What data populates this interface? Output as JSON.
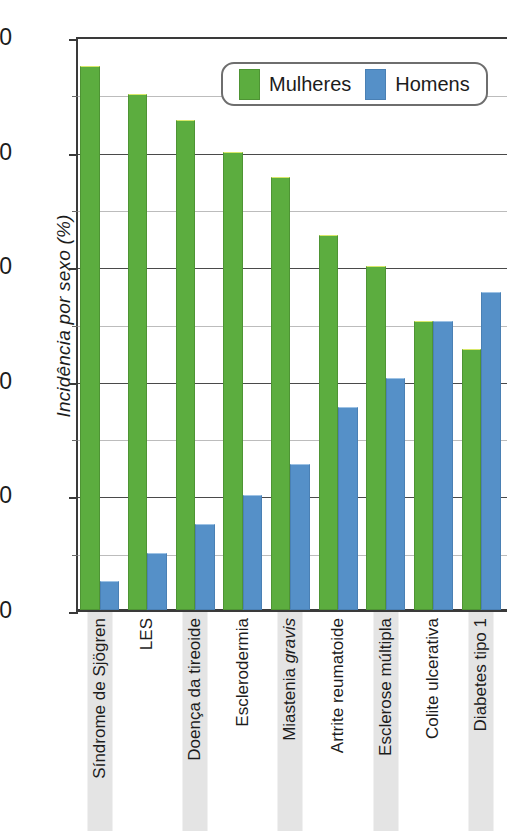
{
  "chart_data": {
    "type": "bar",
    "title": "",
    "xlabel": "",
    "ylabel": "Incidência por sexo (%)",
    "ylim": [
      0,
      100
    ],
    "ytick_labels": [
      "0",
      "20",
      "40",
      "60",
      "80",
      "100"
    ],
    "yticks": [
      0,
      20,
      40,
      60,
      80,
      100
    ],
    "minor_gridlines": [
      10,
      30,
      50,
      70,
      90
    ],
    "grid": true,
    "legend_position": "top-center",
    "categories": [
      "Síndrome de Sjögren",
      "LES",
      "Doença da tireoide",
      "Esclerodermia",
      "Miastenia gravis",
      "Artrite reumatoide",
      "Esclerose múltipla",
      "Colite ulcerativa",
      "Diabetes tipo 1"
    ],
    "series": [
      {
        "name": "Mulheres",
        "color": "#5cad3f",
        "values": [
          95,
          90,
          85.5,
          80,
          75.5,
          65.5,
          60,
          50.5,
          45.5
        ]
      },
      {
        "name": "Homens",
        "color": "#5590c8",
        "values": [
          5,
          10,
          15,
          20,
          25.5,
          35.5,
          40.5,
          50.5,
          55.5
        ]
      }
    ]
  },
  "legend": {
    "items": [
      {
        "label": "Mulheres",
        "swatch": "green-swatch-icon"
      },
      {
        "label": "Homens",
        "swatch": "blue-swatch-icon"
      }
    ]
  },
  "axis": {
    "y_title": "Incidência por sexo (%)"
  }
}
